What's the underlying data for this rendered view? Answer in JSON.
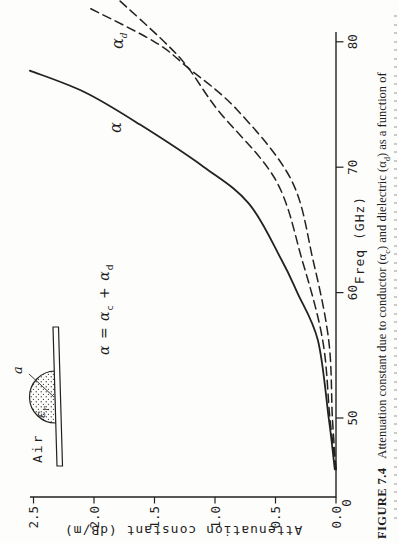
{
  "page": {
    "background": "#fdfdfc",
    "ink": "#1f1f1f"
  },
  "equation": {
    "lhs": "α",
    "eq": "=",
    "t1": "α",
    "t1_sub": "c",
    "op": "+",
    "t2": "α",
    "t2_sub": "d"
  },
  "curve_labels": {
    "alpha": "α",
    "alpha_d_base": "α",
    "alpha_d_sub": "d"
  },
  "inset": {
    "air": "Air",
    "epsilon": "ε",
    "epsilon_sub": "r",
    "radius": "a"
  },
  "caption": {
    "label": "FIGURE 7.4",
    "part1": "Attenuation constant due to conductor (α",
    "sub1": "c",
    "part2": ") and dielectric (α",
    "sub2": "d",
    "part3": ") as a function of"
  },
  "chart_data": {
    "type": "line",
    "title": "",
    "xlabel": "Freq (GHz)",
    "ylabel": "Attenuation constant (dB/m)",
    "x_origin_label": "0",
    "x_ticks": [
      50,
      60,
      70,
      80
    ],
    "y_ticks": [
      "0.0",
      "0.5",
      "1.0",
      "1.5",
      "2.0",
      "2.5"
    ],
    "x_range_ghz": [
      46,
      83
    ],
    "ylim": [
      0,
      2.5
    ],
    "grid": false,
    "legend_position": "labels-on-curves",
    "series": [
      {
        "name": "alpha_total",
        "label": "α",
        "style": "solid",
        "points": [
          [
            45.9,
            0.01
          ],
          [
            47.6,
            0.03
          ],
          [
            50,
            0.06
          ],
          [
            56.2,
            0.15
          ],
          [
            60,
            0.32
          ],
          [
            62.6,
            0.45
          ],
          [
            67.1,
            0.72
          ],
          [
            70,
            1.09
          ],
          [
            73.4,
            1.62
          ],
          [
            76,
            2.08
          ],
          [
            77.7,
            2.53
          ]
        ]
      },
      {
        "name": "alpha_c",
        "label": "αc",
        "style": "dashed",
        "points": [
          [
            45.9,
            0.0
          ],
          [
            50,
            0.05
          ],
          [
            56.2,
            0.11
          ],
          [
            62.6,
            0.28
          ],
          [
            69,
            0.5
          ],
          [
            74.6,
            0.98
          ],
          [
            77.9,
            1.22
          ],
          [
            80,
            1.42
          ],
          [
            83.3,
            1.79
          ]
        ]
      },
      {
        "name": "alpha_d",
        "label": "αd",
        "style": "dashed",
        "points": [
          [
            45.9,
            0.0
          ],
          [
            50,
            0.03
          ],
          [
            56.2,
            0.06
          ],
          [
            62.6,
            0.19
          ],
          [
            69,
            0.37
          ],
          [
            74.6,
            0.82
          ],
          [
            77.9,
            1.22
          ],
          [
            80,
            1.5
          ],
          [
            82.8,
            2.06
          ]
        ]
      }
    ],
    "crossover": {
      "freq_ghz": 78,
      "attenuation_db_per_m": 1.22
    }
  }
}
